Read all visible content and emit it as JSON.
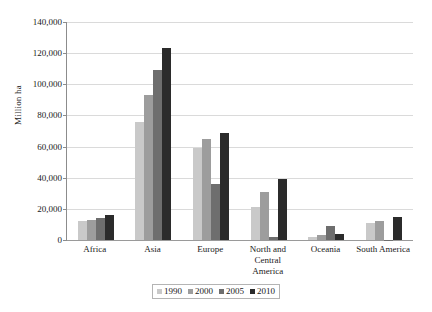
{
  "chart_data": {
    "type": "bar",
    "title": "",
    "xlabel": "",
    "ylabel": "Million ha",
    "ylim": [
      0,
      140000
    ],
    "ytick_step": 20000,
    "ytick_labels": [
      "0",
      "20,000",
      "40,000",
      "60,000",
      "80,000",
      "100,000",
      "120,000",
      "140,000"
    ],
    "ytick_values": [
      0,
      20000,
      40000,
      60000,
      80000,
      100000,
      120000,
      140000
    ],
    "grid": true,
    "legend_position": "bottom",
    "categories": [
      "Africa",
      "Asia",
      "Europe",
      "North and Central America",
      "Oceania",
      "South America"
    ],
    "series": [
      {
        "name": "1990",
        "color": "#c9c9c9",
        "values": [
          12000,
          76000,
          59000,
          21000,
          2000,
          11000
        ]
      },
      {
        "name": "2000",
        "color": "#9d9d9d",
        "values": [
          13000,
          93000,
          65000,
          31000,
          3000,
          12000
        ]
      },
      {
        "name": "2005",
        "color": "#6e6e6e",
        "values": [
          14000,
          109000,
          36000,
          2000,
          9000,
          200
        ]
      },
      {
        "name": "2010",
        "color": "#2b2b2b",
        "values": [
          16000,
          123000,
          69000,
          39000,
          4000,
          15000
        ]
      }
    ]
  }
}
